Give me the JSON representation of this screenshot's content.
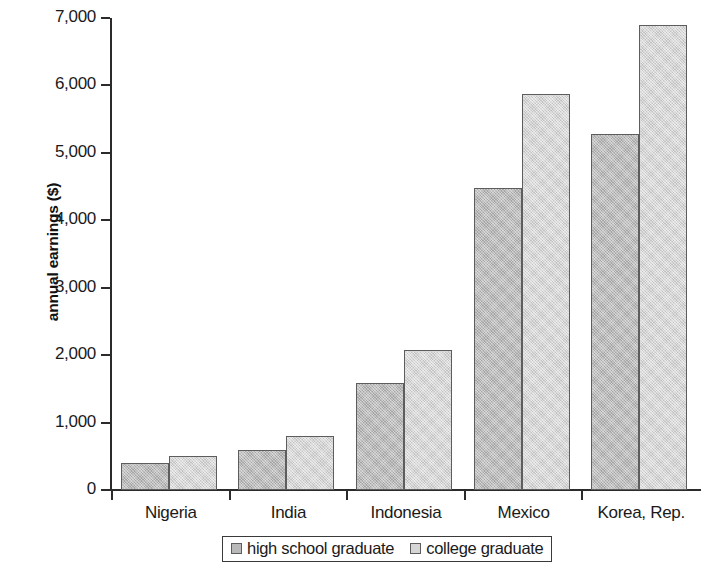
{
  "chart_data": {
    "type": "bar",
    "title": "",
    "xlabel": "",
    "ylabel": "annual earnings ($)",
    "categories": [
      "Nigeria",
      "India",
      "Indonesia",
      "Mexico",
      "Korea, Rep."
    ],
    "series": [
      {
        "name": "high school graduate",
        "color": "#b9b9b9",
        "values": [
          400,
          600,
          1580,
          4480,
          5280
        ]
      },
      {
        "name": "college graduate",
        "color": "#d6d6d6",
        "values": [
          510,
          800,
          2070,
          5880,
          6900
        ]
      }
    ],
    "ylim": [
      0,
      7000
    ],
    "ytick_values": [
      0,
      1000,
      2000,
      3000,
      4000,
      5000,
      6000,
      7000
    ],
    "ytick_labels": [
      "0",
      "1,000",
      "2,000",
      "3,000",
      "4,000",
      "5,000",
      "6,000",
      "7,000"
    ],
    "grid": false,
    "legend_position": "bottom"
  },
  "legend": {
    "entries": [
      {
        "label": "high school graduate"
      },
      {
        "label": "college graduate"
      }
    ]
  },
  "colors": {
    "high_school_graduate": "#b9b9b9",
    "college_graduate": "#d6d6d6",
    "bar_border": "#5d5d5d",
    "axis": "#2b2b2b",
    "text": "#1a1a1a",
    "background": "#ffffff"
  }
}
